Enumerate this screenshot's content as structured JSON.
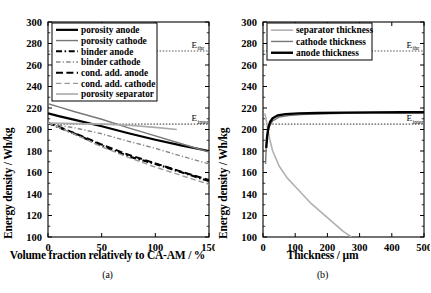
{
  "figure": {
    "panels": [
      {
        "caption": "(a)",
        "xlabel": "Volume fraction relatively to CA-AM / %",
        "ylabel": "Energy density / Wh/kg"
      },
      {
        "caption": "(b)",
        "xlabel": "Thickness / µm",
        "ylabel": "Energy density / Wh/kg"
      }
    ]
  },
  "annotations": {
    "thr_main": "E",
    "thr_sub": "thr",
    "inter_main": "E",
    "inter_sub": "inter"
  },
  "chart_data": [
    {
      "type": "line",
      "title": "(a)",
      "xlabel": "Volume fraction relatively to CA-AM / %",
      "ylabel": "Energy density / Wh/kg",
      "xlim": [
        0,
        150
      ],
      "ylim": [
        100,
        300
      ],
      "xticks": [
        0,
        50,
        100,
        150
      ],
      "yticks": [
        100,
        120,
        140,
        160,
        180,
        200,
        220,
        240,
        260,
        280,
        300
      ],
      "grid": false,
      "legend_position": "upper-left",
      "reference_lines": [
        {
          "name": "E_thr",
          "value": 273,
          "style": "dotted",
          "color": "#555555"
        },
        {
          "name": "E_inter",
          "value": 205,
          "style": "dotted",
          "color": "#555555"
        }
      ],
      "series": [
        {
          "name": "porosity anode",
          "color": "#000000",
          "style": "solid",
          "width": 2.2,
          "x": [
            0,
            10,
            25,
            50,
            75,
            100,
            125,
            150
          ],
          "y": [
            215,
            212.5,
            209,
            203,
            196.5,
            190.5,
            185,
            180
          ]
        },
        {
          "name": "porosity cathode",
          "color": "#777777",
          "style": "solid",
          "width": 1.4,
          "x": [
            0,
            10,
            25,
            50,
            75,
            100,
            125,
            150
          ],
          "y": [
            224,
            221,
            216.5,
            209.5,
            201.5,
            194,
            186.5,
            179
          ]
        },
        {
          "name": "binder anode",
          "color": "#000000",
          "style": "dashdot",
          "width": 2.2,
          "x": [
            0,
            10,
            25,
            50,
            75,
            100,
            125,
            150
          ],
          "y": [
            206,
            202,
            196,
            185,
            175,
            168,
            160,
            152
          ]
        },
        {
          "name": "binder cathode",
          "color": "#888888",
          "style": "dashdot",
          "width": 1.4,
          "x": [
            0,
            10,
            25,
            50,
            75,
            100,
            125,
            150
          ],
          "y": [
            206,
            204,
            201.5,
            196,
            189,
            182.5,
            175,
            168
          ]
        },
        {
          "name": "cond. add. anode",
          "color": "#000000",
          "style": "dashed",
          "width": 2.0,
          "x": [
            0,
            10,
            25,
            50,
            75,
            100,
            125,
            150
          ],
          "y": [
            206,
            202.5,
            196.5,
            186,
            176.5,
            168.5,
            160.5,
            153
          ]
        },
        {
          "name": "cond. add. cathode",
          "color": "#999999",
          "style": "dashed",
          "width": 1.4,
          "x": [
            0,
            10,
            25,
            50,
            75,
            100,
            125,
            150
          ],
          "y": [
            206,
            202,
            195.5,
            184,
            174,
            165,
            157,
            149
          ]
        },
        {
          "name": "porosity separator",
          "color": "#aaaaaa",
          "style": "solid",
          "width": 1.6,
          "x": [
            0,
            25,
            50,
            75,
            100,
            120
          ],
          "y": [
            206,
            205.5,
            205,
            204,
            202,
            200
          ]
        }
      ]
    },
    {
      "type": "line",
      "title": "(b)",
      "xlabel": "Thickness / µm",
      "ylabel": "Energy density / Wh/kg",
      "xlim": [
        0,
        500
      ],
      "ylim": [
        100,
        300
      ],
      "xticks": [
        0,
        100,
        200,
        300,
        400,
        500
      ],
      "yticks": [
        100,
        120,
        140,
        160,
        180,
        200,
        220,
        240,
        260,
        280,
        300
      ],
      "grid": false,
      "legend_position": "upper-left",
      "reference_lines": [
        {
          "name": "E_thr",
          "value": 273,
          "style": "dotted",
          "color": "#555555"
        },
        {
          "name": "E_inter",
          "value": 205,
          "style": "dotted",
          "color": "#555555"
        }
      ],
      "series": [
        {
          "name": "separator thickness",
          "color": "#b0b0b0",
          "style": "solid",
          "width": 1.6,
          "x": [
            5,
            8,
            12,
            20,
            30,
            50,
            75,
            100,
            150,
            200,
            250,
            275
          ],
          "y": [
            215,
            212,
            205,
            192,
            180,
            166,
            155,
            147,
            131,
            118,
            105,
            100
          ]
        },
        {
          "name": "cathode thickness",
          "color": "#777777",
          "style": "solid",
          "width": 1.4,
          "x": [
            8,
            10,
            14,
            20,
            30,
            50,
            80,
            120,
            180,
            260,
            350,
            430,
            500
          ],
          "y": [
            168,
            184,
            196,
            203,
            208,
            211.5,
            213,
            214,
            214.6,
            215,
            215.2,
            215.4,
            215.5
          ]
        },
        {
          "name": "anode thickness",
          "color": "#000000",
          "style": "solid",
          "width": 2.4,
          "x": [
            10,
            13,
            17,
            22,
            30,
            45,
            70,
            110,
            170,
            250,
            340,
            430,
            500
          ],
          "y": [
            183,
            194,
            202,
            207,
            210.5,
            213,
            214.3,
            215,
            215.4,
            215.7,
            215.9,
            216,
            216
          ]
        }
      ]
    }
  ]
}
